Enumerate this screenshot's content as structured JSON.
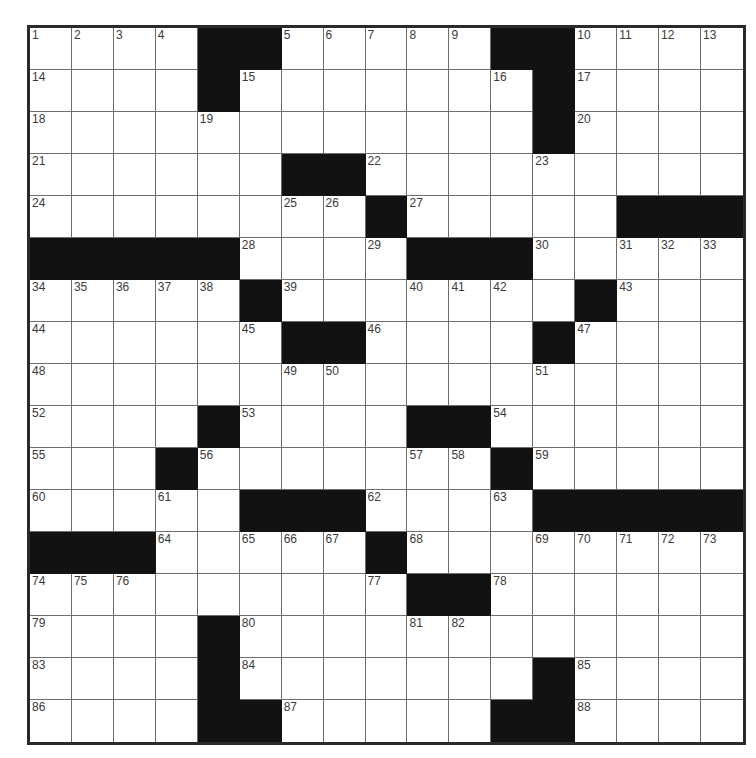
{
  "puzzle": {
    "rows": 17,
    "cols": 17,
    "colors": {
      "block": "#121212",
      "cell": "#ffffff",
      "gridline": "#6e6e6e",
      "border": "#2a2a2a",
      "number": "#3a3a3a"
    },
    "layout": [
      "....##.....##....",
      "....#.......#....",
      "............#....",
      "......##.........",
      "........#.....###",
      "#####....###.....",
      ".....#.......#...",
      "......##....#....",
      ".................",
      "....#....##......",
      "...#.......#.....",
      ".....###....#####",
      "###.....#........",
      ".........##......",
      "....#............",
      "....#.......#....",
      "....##.....##...."
    ],
    "numbers": [
      {
        "n": "1",
        "r": 0,
        "c": 0
      },
      {
        "n": "2",
        "r": 0,
        "c": 1
      },
      {
        "n": "3",
        "r": 0,
        "c": 2
      },
      {
        "n": "4",
        "r": 0,
        "c": 3
      },
      {
        "n": "5",
        "r": 0,
        "c": 6
      },
      {
        "n": "6",
        "r": 0,
        "c": 7
      },
      {
        "n": "7",
        "r": 0,
        "c": 8
      },
      {
        "n": "8",
        "r": 0,
        "c": 9
      },
      {
        "n": "9",
        "r": 0,
        "c": 10
      },
      {
        "n": "10",
        "r": 0,
        "c": 13
      },
      {
        "n": "11",
        "r": 0,
        "c": 14
      },
      {
        "n": "12",
        "r": 0,
        "c": 15
      },
      {
        "n": "13",
        "r": 0,
        "c": 16
      },
      {
        "n": "14",
        "r": 1,
        "c": 0
      },
      {
        "n": "15",
        "r": 1,
        "c": 5
      },
      {
        "n": "16",
        "r": 1,
        "c": 11
      },
      {
        "n": "17",
        "r": 1,
        "c": 13
      },
      {
        "n": "18",
        "r": 2,
        "c": 0
      },
      {
        "n": "19",
        "r": 2,
        "c": 4
      },
      {
        "n": "20",
        "r": 2,
        "c": 13
      },
      {
        "n": "21",
        "r": 3,
        "c": 0
      },
      {
        "n": "22",
        "r": 3,
        "c": 8
      },
      {
        "n": "23",
        "r": 3,
        "c": 12
      },
      {
        "n": "24",
        "r": 4,
        "c": 0
      },
      {
        "n": "25",
        "r": 4,
        "c": 6
      },
      {
        "n": "26",
        "r": 4,
        "c": 7
      },
      {
        "n": "27",
        "r": 4,
        "c": 9
      },
      {
        "n": "28",
        "r": 5,
        "c": 5
      },
      {
        "n": "29",
        "r": 5,
        "c": 8
      },
      {
        "n": "30",
        "r": 5,
        "c": 12
      },
      {
        "n": "31",
        "r": 5,
        "c": 14
      },
      {
        "n": "32",
        "r": 5,
        "c": 15
      },
      {
        "n": "33",
        "r": 5,
        "c": 16
      },
      {
        "n": "34",
        "r": 6,
        "c": 0
      },
      {
        "n": "35",
        "r": 6,
        "c": 1
      },
      {
        "n": "36",
        "r": 6,
        "c": 2
      },
      {
        "n": "37",
        "r": 6,
        "c": 3
      },
      {
        "n": "38",
        "r": 6,
        "c": 4
      },
      {
        "n": "39",
        "r": 6,
        "c": 6
      },
      {
        "n": "40",
        "r": 6,
        "c": 9
      },
      {
        "n": "41",
        "r": 6,
        "c": 10
      },
      {
        "n": "42",
        "r": 6,
        "c": 11
      },
      {
        "n": "43",
        "r": 6,
        "c": 14
      },
      {
        "n": "44",
        "r": 7,
        "c": 0
      },
      {
        "n": "45",
        "r": 7,
        "c": 5
      },
      {
        "n": "46",
        "r": 7,
        "c": 8
      },
      {
        "n": "47",
        "r": 7,
        "c": 13
      },
      {
        "n": "48",
        "r": 8,
        "c": 0
      },
      {
        "n": "49",
        "r": 8,
        "c": 6
      },
      {
        "n": "50",
        "r": 8,
        "c": 7
      },
      {
        "n": "51",
        "r": 8,
        "c": 12
      },
      {
        "n": "52",
        "r": 9,
        "c": 0
      },
      {
        "n": "53",
        "r": 9,
        "c": 5
      },
      {
        "n": "54",
        "r": 9,
        "c": 11
      },
      {
        "n": "55",
        "r": 10,
        "c": 0
      },
      {
        "n": "56",
        "r": 10,
        "c": 4
      },
      {
        "n": "57",
        "r": 10,
        "c": 9
      },
      {
        "n": "58",
        "r": 10,
        "c": 10
      },
      {
        "n": "59",
        "r": 10,
        "c": 12
      },
      {
        "n": "60",
        "r": 11,
        "c": 0
      },
      {
        "n": "61",
        "r": 11,
        "c": 3
      },
      {
        "n": "62",
        "r": 11,
        "c": 8
      },
      {
        "n": "63",
        "r": 11,
        "c": 11
      },
      {
        "n": "64",
        "r": 12,
        "c": 3
      },
      {
        "n": "65",
        "r": 12,
        "c": 5
      },
      {
        "n": "66",
        "r": 12,
        "c": 6
      },
      {
        "n": "67",
        "r": 12,
        "c": 7
      },
      {
        "n": "68",
        "r": 12,
        "c": 9
      },
      {
        "n": "69",
        "r": 12,
        "c": 12
      },
      {
        "n": "70",
        "r": 12,
        "c": 13
      },
      {
        "n": "71",
        "r": 12,
        "c": 14
      },
      {
        "n": "72",
        "r": 12,
        "c": 15
      },
      {
        "n": "73",
        "r": 12,
        "c": 16
      },
      {
        "n": "74",
        "r": 13,
        "c": 0
      },
      {
        "n": "75",
        "r": 13,
        "c": 1
      },
      {
        "n": "76",
        "r": 13,
        "c": 2
      },
      {
        "n": "77",
        "r": 13,
        "c": 8
      },
      {
        "n": "78",
        "r": 13,
        "c": 11
      },
      {
        "n": "79",
        "r": 14,
        "c": 0
      },
      {
        "n": "80",
        "r": 14,
        "c": 5
      },
      {
        "n": "81",
        "r": 14,
        "c": 9
      },
      {
        "n": "82",
        "r": 14,
        "c": 10
      },
      {
        "n": "83",
        "r": 15,
        "c": 0
      },
      {
        "n": "84",
        "r": 15,
        "c": 5
      },
      {
        "n": "85",
        "r": 15,
        "c": 13
      },
      {
        "n": "86",
        "r": 16,
        "c": 0
      },
      {
        "n": "87",
        "r": 16,
        "c": 6
      },
      {
        "n": "88",
        "r": 16,
        "c": 13
      }
    ]
  }
}
